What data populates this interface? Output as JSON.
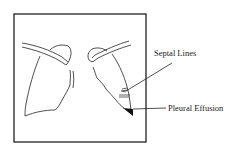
{
  "diagram": {
    "type": "anatomical-line-drawing",
    "labels": {
      "septal_lines": "Septal Lines",
      "pleural_effusion": "Pleural Effusion"
    },
    "colors": {
      "stroke": "#222222",
      "background": "#ffffff"
    }
  }
}
